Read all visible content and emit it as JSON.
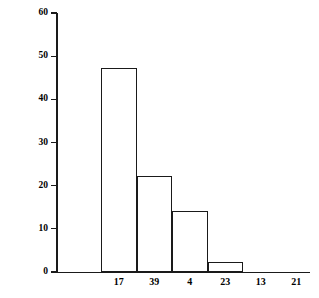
{
  "chart_data": {
    "type": "bar",
    "title": "",
    "xlabel": "",
    "ylabel": "PERCENT POSITIVE",
    "categories": [
      "17",
      "39",
      "4",
      "23",
      "13",
      "21"
    ],
    "values": [
      47.2,
      22.2,
      14.1,
      2.3,
      0,
      0
    ],
    "ylim": [
      0,
      60
    ],
    "yticks": [
      0,
      10,
      20,
      30,
      40,
      50,
      60
    ],
    "ytick_labels": [
      "0",
      "10",
      "20",
      "30",
      "40",
      "50",
      "60"
    ],
    "grid": false,
    "legend": null,
    "bar_style": {
      "fill": "#ffffff",
      "edge": "#1a1a1a",
      "adjacent": true
    },
    "axis_color": "#1a1a1a",
    "background": "#ffffff"
  }
}
